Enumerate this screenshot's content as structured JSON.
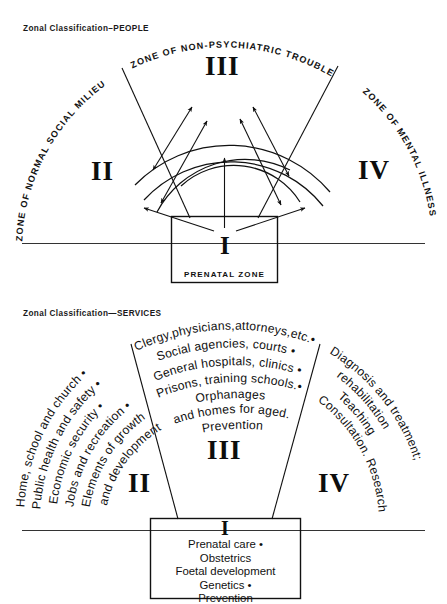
{
  "diagram": {
    "title_people": "Zonal Classification–PEOPLE",
    "title_services": "Zonal Classification—SERVICES"
  },
  "people_panel": {
    "zone_labels": {
      "zone2": "ZONE OF NORMAL SOCIAL MILIEU",
      "zone3": "ZONE OF NON-PSYCHIATRIC TROUBLE",
      "zone4": "ZONE OF MENTAL ILLNESS"
    },
    "numerals": {
      "zone1": "I",
      "zone2": "II",
      "zone3": "III",
      "zone4": "IV"
    },
    "center_box_label": "PRENATAL ZONE"
  },
  "services_panel": {
    "numerals": {
      "zone1": "I",
      "zone2": "II",
      "zone3": "III",
      "zone4": "IV"
    },
    "zone2_lines": [
      "Home, school and church •",
      "Public health and safety •",
      "Economic security •",
      "Jobs and recreation •",
      "Elements of growth",
      "and development"
    ],
    "zone3_lines": [
      "Clergy,physicians,attorneys,etc.•",
      "Social agencies, courts •",
      "General  hospitals, clinics •",
      "Prisons, training  schools.•",
      "Orphanages",
      "and homes for aged.",
      "Prevention"
    ],
    "zone4_lines": [
      "Diagnosis and treatment;",
      "rehabilitation",
      "Teaching",
      "Consultation. Research"
    ],
    "center_box_lines": [
      "Prenatal care •",
      "Obstetrics",
      "Foetal development",
      "Genetics •",
      "Prevention"
    ]
  },
  "colors": {
    "ink": "#111111",
    "paper": "#ffffff"
  }
}
